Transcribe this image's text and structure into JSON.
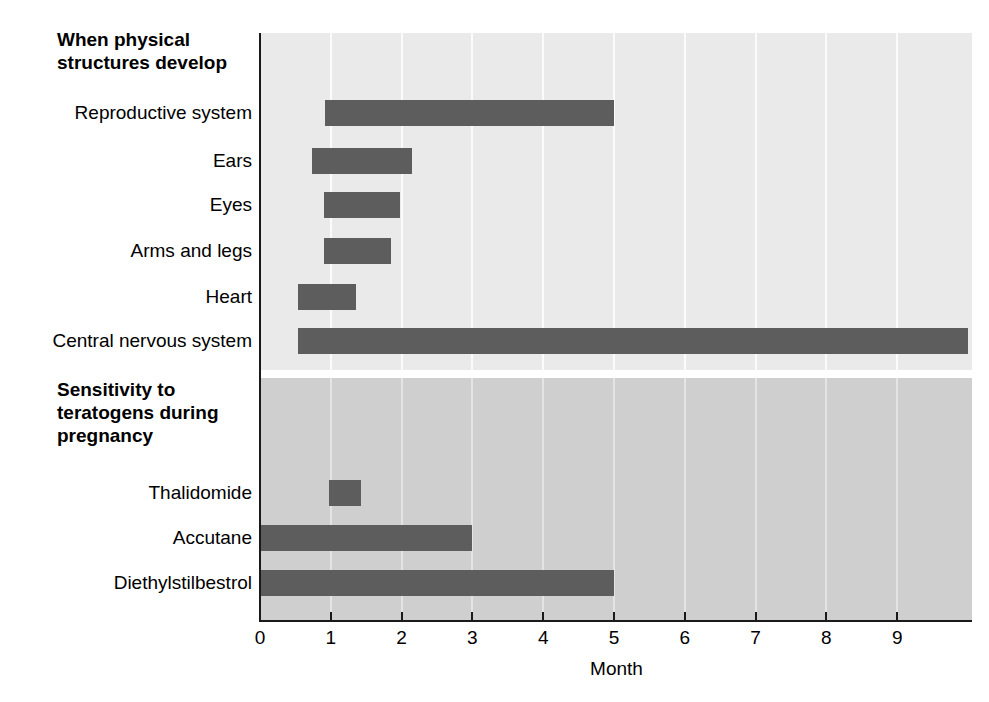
{
  "chart_data": {
    "type": "bar",
    "orientation": "horizontal",
    "title": "",
    "subtitle": "",
    "xlabel": "Month",
    "ylabel": "",
    "xlim": [
      0,
      10.05
    ],
    "xticks": [
      0,
      1,
      2,
      3,
      4,
      5,
      6,
      7,
      8,
      9
    ],
    "xticklabels": [
      "0",
      "1",
      "2",
      "3",
      "4",
      "5",
      "6",
      "7",
      "8",
      "9"
    ],
    "grid": "vertical gridlines at each month tick",
    "legend": "none",
    "bar_color": "#5d5d5d",
    "panels": [
      {
        "heading": "When physical structures develop",
        "background": "#eaeaea",
        "bars": [
          {
            "label": "Reproductive system",
            "start": 0.92,
            "end": 5.0
          },
          {
            "label": "Ears",
            "start": 0.74,
            "end": 2.15
          },
          {
            "label": "Eyes",
            "start": 0.9,
            "end": 1.98
          },
          {
            "label": "Arms and legs",
            "start": 0.9,
            "end": 1.85
          },
          {
            "label": "Heart",
            "start": 0.54,
            "end": 1.35
          },
          {
            "label": "Central nervous system",
            "start": 0.54,
            "end": 10.0
          }
        ]
      },
      {
        "heading": "Sensitivity to teratogens during pregnancy",
        "background": "#cfcfcf",
        "bars": [
          {
            "label": "Thalidomide",
            "start": 0.98,
            "end": 1.42
          },
          {
            "label": "Accutane",
            "start": 0.0,
            "end": 3.0
          },
          {
            "label": "Diethylstilbestrol",
            "start": 0.0,
            "end": 5.0
          }
        ]
      }
    ]
  },
  "headings": {
    "top": [
      "When physical",
      "structures develop"
    ],
    "bottom": [
      "Sensitivity to",
      "teratogens during",
      "pregnancy"
    ]
  },
  "labels": {
    "reproductive_system": "Reproductive system",
    "ears": "Ears",
    "eyes": "Eyes",
    "arms_and_legs": "Arms and legs",
    "heart": "Heart",
    "central_nervous_system": "Central nervous system",
    "thalidomide": "Thalidomide",
    "accutane": "Accutane",
    "diethylstilbestrol": "Diethylstilbestrol"
  },
  "axis": {
    "title": "Month",
    "ticks": [
      "0",
      "1",
      "2",
      "3",
      "4",
      "5",
      "6",
      "7",
      "8",
      "9"
    ]
  },
  "colors": {
    "bar": "#5d5d5d",
    "panel_top": "#eaeaea",
    "panel_bottom": "#cfcfcf",
    "axis": "#1a1a1a",
    "gridline_top": "#fbfbfb",
    "gridline_bottom": "#e4e4e4",
    "page": "#ffffff"
  }
}
